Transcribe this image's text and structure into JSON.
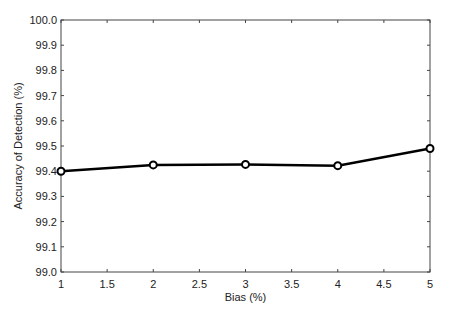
{
  "chart_data": {
    "type": "line",
    "title": "",
    "xlabel": "Bias (%)",
    "ylabel": "Accuracy of Detection (%)",
    "x": [
      1,
      2,
      3,
      4,
      5
    ],
    "series": [
      {
        "name": "Accuracy",
        "values": [
          99.4,
          99.425,
          99.427,
          99.422,
          99.49
        ],
        "marker": "circle",
        "color": "#000000"
      }
    ],
    "xlim": [
      1,
      5
    ],
    "ylim": [
      99.0,
      100.0
    ],
    "xticks": [
      "1",
      "1.5",
      "2",
      "2.5",
      "3",
      "3.5",
      "4",
      "4.5",
      "5"
    ],
    "yticks": [
      "99.0",
      "99.1",
      "99.2",
      "99.3",
      "99.4",
      "99.5",
      "99.6",
      "99.7",
      "99.8",
      "99.9",
      "100.0"
    ],
    "grid": false,
    "legend": null
  }
}
